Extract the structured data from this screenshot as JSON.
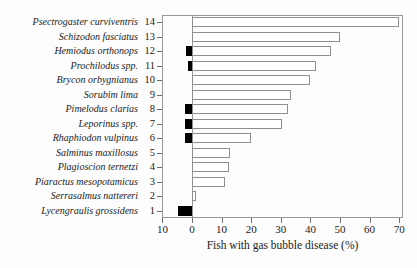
{
  "chart_data": {
    "type": "bar",
    "orientation": "horizontal",
    "title": "",
    "xlabel": "Fish with gas bubble disease (%)",
    "ylabel": "",
    "xlim": [
      -10,
      71
    ],
    "grid": false,
    "legend": "none",
    "x_ticks": [
      -10,
      0,
      10,
      20,
      30,
      40,
      50,
      60,
      70
    ],
    "x_tick_labels": [
      "10",
      "0",
      "10",
      "20",
      "30",
      "40",
      "50",
      "60",
      "70"
    ],
    "bar_styles": {
      "right_bar_fill": "#ffffff",
      "right_bar_border": "#8f8f8f",
      "left_bar_fill": "#000000"
    },
    "rows": [
      {
        "rank": 14,
        "species": "Psectrogaster curviventris",
        "white_right_pct": 70,
        "black_left_pct": 0
      },
      {
        "rank": 13,
        "species": "Schizodon fasciatus",
        "white_right_pct": 50,
        "black_left_pct": 0
      },
      {
        "rank": 12,
        "species": "Hemiodus orthonops",
        "white_right_pct": 47,
        "black_left_pct": 2
      },
      {
        "rank": 11,
        "species": "Prochilodus spp.",
        "white_right_pct": 42,
        "black_left_pct": 1.5
      },
      {
        "rank": 10,
        "species": "Brycon orbygnianus",
        "white_right_pct": 40,
        "black_left_pct": 0
      },
      {
        "rank": 9,
        "species": "Sorubim lima",
        "white_right_pct": 33.5,
        "black_left_pct": 0
      },
      {
        "rank": 8,
        "species": "Pimelodus clarias",
        "white_right_pct": 32.5,
        "black_left_pct": 2.5
      },
      {
        "rank": 7,
        "species": "Leporinus spp.",
        "white_right_pct": 30.5,
        "black_left_pct": 2.5
      },
      {
        "rank": 6,
        "species": "Rhaphiodon vulpinus",
        "white_right_pct": 20,
        "black_left_pct": 2.5
      },
      {
        "rank": 5,
        "species": "Salminus maxillosus",
        "white_right_pct": 13,
        "black_left_pct": 0
      },
      {
        "rank": 4,
        "species": "Plagioscion ternetzi",
        "white_right_pct": 12.5,
        "black_left_pct": 0
      },
      {
        "rank": 3,
        "species": "Piaractus mesopotamicus",
        "white_right_pct": 11,
        "black_left_pct": 0
      },
      {
        "rank": 2,
        "species": "Serrasalmus nattereri",
        "white_right_pct": 1.2,
        "black_left_pct": 0
      },
      {
        "rank": 1,
        "species": "Lycengraulis grossidens",
        "white_right_pct": 0,
        "black_left_pct": 4.7
      }
    ]
  }
}
